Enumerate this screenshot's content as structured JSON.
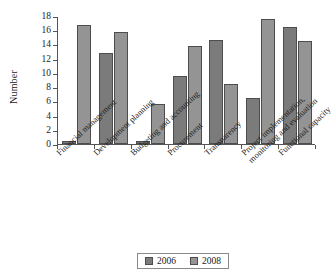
{
  "chart_data": {
    "type": "bar",
    "title": "",
    "xlabel": "",
    "ylabel": "Number",
    "ylim": [
      0,
      18
    ],
    "ytick_step": 2,
    "yticks": [
      0,
      2,
      4,
      6,
      8,
      10,
      12,
      14,
      16,
      18
    ],
    "grid": false,
    "legend_position": "bottom",
    "categories": [
      "Financial management",
      "Development planning",
      "Budgeting and accounting",
      "Procurement",
      "Transparency",
      "Project implementation, monitoring and evaluation",
      "Functional capacity"
    ],
    "category_lines": [
      [
        "Financial management",
        ""
      ],
      [
        "Development planning",
        ""
      ],
      [
        "Budgeting and accounting",
        ""
      ],
      [
        "Procurement",
        ""
      ],
      [
        "Transparency",
        ""
      ],
      [
        "Project implementation,",
        "monitoring and evaluation"
      ],
      [
        "Functional capacity",
        ""
      ]
    ],
    "series": [
      {
        "name": "2006",
        "color": "#7b7b7b",
        "values": [
          0.4,
          12.8,
          0.4,
          9.5,
          14.6,
          6.5,
          16.5
        ]
      },
      {
        "name": "2008",
        "color": "#949494",
        "values": [
          16.8,
          15.7,
          5.6,
          13.8,
          8.5,
          17.6,
          14.5
        ]
      }
    ]
  },
  "legend": {
    "items": [
      {
        "label": "2006",
        "color": "#7b7b7b"
      },
      {
        "label": "2008",
        "color": "#949494"
      }
    ]
  }
}
